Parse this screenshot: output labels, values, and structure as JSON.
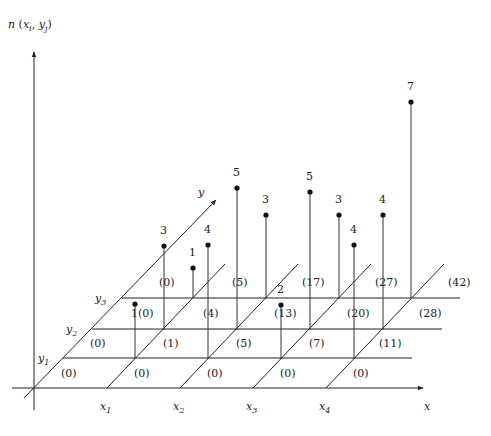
{
  "title": {
    "text": "n (x_i, y_j)",
    "n": "n",
    "x": "x",
    "xsub": "i",
    "y": "y",
    "ysub": "j"
  },
  "axes": {
    "x_label": "x",
    "y_label": "y",
    "x_ticks": [
      {
        "name": "x",
        "sub": "1"
      },
      {
        "name": "x",
        "sub": "2"
      },
      {
        "name": "x",
        "sub": "3"
      },
      {
        "name": "x",
        "sub": "4"
      }
    ],
    "y_ticks": [
      {
        "name": "y",
        "sub": "1"
      },
      {
        "name": "y",
        "sub": "2"
      },
      {
        "name": "y",
        "sub": "3"
      }
    ]
  },
  "cells": {
    "row_y0": [
      "(0)",
      "(0)",
      "(0)",
      "(0)",
      "(0)"
    ],
    "row_y1": [
      "(0)",
      "(1)",
      "(5)",
      "(7)",
      "(11)"
    ],
    "row_y2": [
      "1(0)",
      "(4)",
      "(13)",
      "(20)",
      "(28)"
    ],
    "row_y3": [
      "(0)",
      "(5)",
      "(17)",
      "(27)",
      "(42)"
    ]
  },
  "stems": [
    {
      "value": "",
      "x": 135,
      "base": 359,
      "top": 304
    },
    {
      "value": "3",
      "x": 164,
      "base": 330,
      "top": 246
    },
    {
      "value": "1",
      "x": 193,
      "base": 298,
      "top": 268
    },
    {
      "value": "4",
      "x": 208,
      "base": 359,
      "top": 245
    },
    {
      "value": "5",
      "x": 237,
      "base": 330,
      "top": 188
    },
    {
      "value": "3",
      "x": 266,
      "base": 298,
      "top": 215
    },
    {
      "value": "2",
      "x": 281,
      "base": 359,
      "top": 305
    },
    {
      "value": "5",
      "x": 310,
      "base": 330,
      "top": 192
    },
    {
      "value": "3",
      "x": 339,
      "base": 298,
      "top": 215
    },
    {
      "value": "4",
      "x": 354,
      "base": 359,
      "top": 245
    },
    {
      "value": "4",
      "x": 383,
      "base": 330,
      "top": 215
    },
    {
      "value": "7",
      "x": 411,
      "base": 298,
      "top": 102
    }
  ],
  "colors": {
    "line": "#222222",
    "background": "#ffffff"
  }
}
